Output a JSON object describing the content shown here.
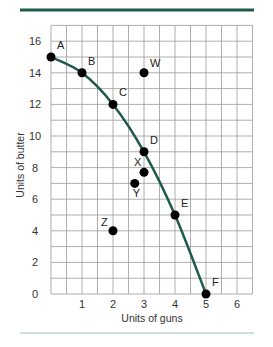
{
  "chart_data": {
    "type": "scatter",
    "title": "",
    "xlabel": "Units of guns",
    "ylabel": "Units of butter",
    "xlim": [
      0,
      6.5
    ],
    "ylim": [
      0,
      17
    ],
    "grid": true,
    "grid_x_step": 0.5,
    "grid_y_step": 1,
    "x_ticks": [
      1,
      2,
      3,
      4,
      5,
      6
    ],
    "y_ticks": [
      0,
      2,
      4,
      6,
      8,
      10,
      12,
      14,
      16
    ],
    "curve": {
      "name": "Production possibilities frontier",
      "type": "line",
      "points": [
        {
          "label": "A",
          "x": 0,
          "y": 15
        },
        {
          "label": "B",
          "x": 1,
          "y": 14
        },
        {
          "label": "C",
          "x": 2,
          "y": 12
        },
        {
          "label": "D",
          "x": 3,
          "y": 9
        },
        {
          "label": "E",
          "x": 4,
          "y": 5
        },
        {
          "label": "F",
          "x": 5,
          "y": 0
        }
      ]
    },
    "other_points": [
      {
        "label": "W",
        "x": 3,
        "y": 14
      },
      {
        "label": "X",
        "x": 3,
        "y": 7.7
      },
      {
        "label": "Y",
        "x": 2.7,
        "y": 7
      },
      {
        "label": "Z",
        "x": 2,
        "y": 4
      }
    ],
    "colors": {
      "curve": "#1f5a4e",
      "rule": "#1f5a4e",
      "grid": "#9a9a9a",
      "points": "#000000"
    }
  }
}
